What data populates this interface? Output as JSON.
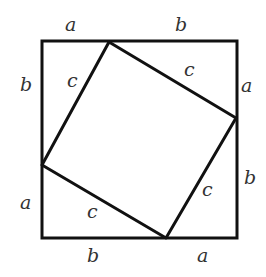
{
  "diagram": {
    "stroke_color": "#111111",
    "outer_square": {
      "x1": 42,
      "y1": 41,
      "x2": 237,
      "y2": 238
    },
    "inner_square_points": "109,42 236,118 166,238 42,165",
    "labels": {
      "top_a": "a",
      "top_b": "b",
      "left_b": "b",
      "left_a": "a",
      "right_a": "a",
      "right_b": "b",
      "bottom_b": "b",
      "bottom_a": "a",
      "c_top_left": "c",
      "c_top_right": "c",
      "c_bottom_left": "c",
      "c_bottom_right": "c"
    }
  }
}
